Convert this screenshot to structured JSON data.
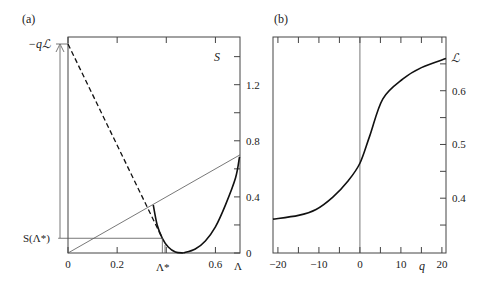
{
  "chart_data": [
    {
      "panel": "(a)",
      "type": "line",
      "title": "",
      "xlabel": "Λ",
      "ylabel": "S",
      "xlim": [
        0,
        0.7
      ],
      "ylim": [
        0,
        1.54
      ],
      "xticks": [
        0,
        0.2,
        0.4,
        0.6
      ],
      "xtick_labels": [
        "0",
        "0.2",
        "",
        "0.6"
      ],
      "yticks": [
        0,
        0.2,
        0.4,
        0.6,
        0.8,
        1.0,
        1.2,
        1.4
      ],
      "ytick_labels": [
        "0",
        "",
        "0.4",
        "",
        "0.8",
        "",
        "1.2",
        ""
      ],
      "grid": false,
      "annotations": {
        "top_left": "−qℒ",
        "bottom_left": "S(Λ*)",
        "lambda_star": "Λ*"
      },
      "lambda_star": 0.384,
      "S_at_lambda_star": 0.105,
      "minus_qL": 1.49,
      "series": [
        {
          "name": "S(Λ) left branch",
          "style": "solid-thick",
          "x": [
            0.347,
            0.363,
            0.384,
            0.408,
            0.437,
            0.469
          ],
          "y": [
            0.343,
            0.2,
            0.105,
            0.043,
            0.007,
            0.0
          ]
        },
        {
          "name": "S(Λ) right branch",
          "style": "solid-thick",
          "x": [
            0.469,
            0.518,
            0.559,
            0.6,
            0.641,
            0.682,
            0.698
          ],
          "y": [
            0.0,
            0.029,
            0.086,
            0.186,
            0.343,
            0.536,
            0.686
          ]
        },
        {
          "name": "tangent at Λ*",
          "style": "dashed",
          "x": [
            0,
            0.384
          ],
          "y": [
            1.49,
            0.105
          ]
        },
        {
          "name": "chord",
          "style": "thin",
          "x": [
            0,
            0.7
          ],
          "y": [
            0,
            0.7
          ]
        },
        {
          "name": "S(Λ*) level",
          "style": "thin",
          "x": [
            -0.04,
            0.384
          ],
          "y": [
            0.105,
            0.105
          ]
        }
      ]
    },
    {
      "panel": "(b)",
      "type": "line",
      "title": "",
      "xlabel": "q",
      "ylabel": "ℒ",
      "xlim": [
        -21.2,
        21
      ],
      "ylim": [
        0.298,
        0.7
      ],
      "xticks": [
        -20,
        -15,
        -10,
        -5,
        0,
        5,
        10,
        15,
        20
      ],
      "xtick_labels": [
        "−20",
        "",
        "−10",
        "",
        "0",
        "",
        "10",
        "",
        "20"
      ],
      "yticks": [
        0.35,
        0.4,
        0.45,
        0.5,
        0.55,
        0.6,
        0.65
      ],
      "ytick_labels": [
        "",
        "0.4",
        "",
        "0.5",
        "",
        "0.6",
        ""
      ],
      "grid": false,
      "vline_at": 0,
      "series": [
        {
          "name": "ℒ(q)",
          "x": [
            -21.2,
            -15,
            -10.7,
            -6.6,
            -2.9,
            0,
            2.4,
            5.6,
            10.5,
            15,
            21
          ],
          "y": [
            0.361,
            0.368,
            0.379,
            0.402,
            0.432,
            0.465,
            0.516,
            0.585,
            0.622,
            0.643,
            0.66
          ]
        }
      ]
    }
  ]
}
